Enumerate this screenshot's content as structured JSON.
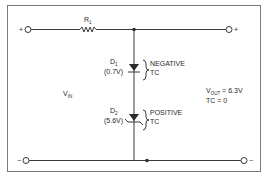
{
  "diagram": {
    "type": "circuit-schematic",
    "terminals": {
      "top_left": "+",
      "top_right": "+",
      "bottom_left": "−",
      "bottom_right": "−"
    },
    "resistor": {
      "label": "R",
      "subscript": "1"
    },
    "diodes": [
      {
        "label": "D",
        "subscript": "1",
        "voltage": "(0.7V)",
        "tc_line1": "NEGATIVE",
        "tc_line2": "TC"
      },
      {
        "label": "D",
        "subscript": "2",
        "voltage": "(5.6V)",
        "tc_line1": "POSITIVE",
        "tc_line2": "TC"
      }
    ],
    "input": {
      "label": "V",
      "subscript": "IN"
    },
    "output": {
      "label": "V",
      "subscript": "OUT",
      "value_text": " = 6.3V",
      "tc_text": "TC = 0"
    },
    "colors": {
      "wire": "#3a3a3a",
      "frame": "#7a7a7a",
      "text": "#2a2a2a",
      "background": "#ffffff"
    }
  }
}
